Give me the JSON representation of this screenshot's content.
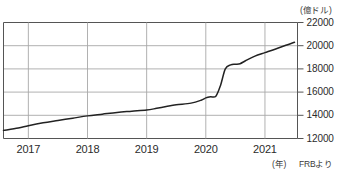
{
  "chart_data": {
    "type": "line",
    "title": "",
    "subtitle": "",
    "xlabel": "(年)",
    "ylabel": "(億ドル)",
    "source_note": "FRBより",
    "grid": true,
    "legend": false,
    "xlim": [
      2016.58,
      2021.55
    ],
    "ylim": [
      12000,
      22000
    ],
    "yticks": [
      12000,
      14000,
      16000,
      18000,
      20000,
      22000
    ],
    "ytick_labels": [
      "12000",
      "14000",
      "16000",
      "18000",
      "20000",
      "22000"
    ],
    "xticks": [
      2017,
      2018,
      2019,
      2020,
      2021
    ],
    "xtick_labels": [
      "2017",
      "2018",
      "2019",
      "2020",
      "2021"
    ],
    "line_color": "#222222",
    "grid_color": "#a8a8a8",
    "axis_color": "#555555",
    "series": [
      {
        "name": "FRB総資産",
        "x": [
          2016.58,
          2016.83,
          2017.0,
          2017.25,
          2017.5,
          2017.75,
          2018.0,
          2018.25,
          2018.5,
          2018.75,
          2019.0,
          2019.17,
          2019.33,
          2019.5,
          2019.75,
          2019.92,
          2020.0,
          2020.08,
          2020.17,
          2020.25,
          2020.33,
          2020.42,
          2020.5,
          2020.58,
          2020.67,
          2020.83,
          2021.0,
          2021.17,
          2021.33,
          2021.5
        ],
        "values": [
          12700,
          12900,
          13100,
          13350,
          13550,
          13750,
          13950,
          14100,
          14250,
          14350,
          14450,
          14600,
          14750,
          14900,
          15050,
          15300,
          15500,
          15600,
          15650,
          16600,
          18000,
          18350,
          18400,
          18450,
          18700,
          19100,
          19400,
          19700,
          20000,
          20300
        ]
      }
    ]
  }
}
